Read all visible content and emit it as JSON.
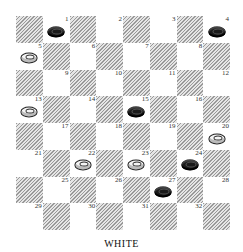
{
  "board": {
    "title": "WHITE",
    "colors": {
      "dark_square": "#9a9a9a",
      "light_square": "#ffffff",
      "black_piece": "#1a1a1a",
      "white_piece": "#f4f4f4"
    },
    "squares": [
      {
        "n": "1",
        "piece": "black"
      },
      {
        "n": "2",
        "piece": ""
      },
      {
        "n": "3",
        "piece": ""
      },
      {
        "n": "4",
        "piece": "black"
      },
      {
        "n": "5",
        "piece": "white"
      },
      {
        "n": "6",
        "piece": ""
      },
      {
        "n": "7",
        "piece": ""
      },
      {
        "n": "8",
        "piece": ""
      },
      {
        "n": "9",
        "piece": ""
      },
      {
        "n": "10",
        "piece": ""
      },
      {
        "n": "11",
        "piece": ""
      },
      {
        "n": "12",
        "piece": ""
      },
      {
        "n": "13",
        "piece": "white"
      },
      {
        "n": "14",
        "piece": ""
      },
      {
        "n": "15",
        "piece": "black"
      },
      {
        "n": "16",
        "piece": ""
      },
      {
        "n": "17",
        "piece": ""
      },
      {
        "n": "18",
        "piece": ""
      },
      {
        "n": "19",
        "piece": ""
      },
      {
        "n": "20",
        "piece": "white"
      },
      {
        "n": "21",
        "piece": ""
      },
      {
        "n": "22",
        "piece": "white"
      },
      {
        "n": "23",
        "piece": "white"
      },
      {
        "n": "24",
        "piece": "black"
      },
      {
        "n": "25",
        "piece": ""
      },
      {
        "n": "26",
        "piece": ""
      },
      {
        "n": "27",
        "piece": "black"
      },
      {
        "n": "28",
        "piece": ""
      },
      {
        "n": "29",
        "piece": ""
      },
      {
        "n": "30",
        "piece": ""
      },
      {
        "n": "31",
        "piece": ""
      },
      {
        "n": "32",
        "piece": ""
      }
    ]
  }
}
